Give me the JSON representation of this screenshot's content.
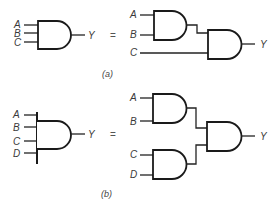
{
  "figure": {
    "part_a": {
      "caption": "(a)",
      "lhs": {
        "inputs": [
          "A",
          "B",
          "C"
        ],
        "output": "Y",
        "gate": "3-input AND"
      },
      "equals": "=",
      "rhs": {
        "inputs": [
          "A",
          "B",
          "C"
        ],
        "output": "Y",
        "gates": [
          "AND(A,B)",
          "AND(AND(A,B),C)"
        ]
      }
    },
    "part_b": {
      "caption": "(b)",
      "lhs": {
        "inputs": [
          "A",
          "B",
          "C",
          "D"
        ],
        "output": "Y",
        "gate": "4-input AND"
      },
      "equals": "=",
      "rhs": {
        "inputs": [
          "A",
          "B",
          "C",
          "D"
        ],
        "output": "Y",
        "gates": [
          "AND(A,B)",
          "AND(C,D)",
          "AND(AND(A,B),AND(C,D))"
        ]
      }
    }
  }
}
